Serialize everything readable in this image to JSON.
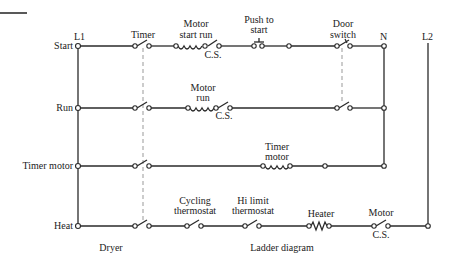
{
  "diagram": {
    "type": "ladder-diagram",
    "caption_left": "Dryer",
    "caption_right": "Ladder diagram",
    "rails": {
      "left": "L1",
      "neutral": "N",
      "right": "L2"
    },
    "rungs": [
      {
        "label": "Start",
        "components": [
          "Timer",
          "Motor start run",
          "C.S.",
          "Push to start",
          "Door switch"
        ]
      },
      {
        "label": "Run",
        "components": [
          "Timer",
          "Motor run",
          "C.S.",
          "Door switch"
        ]
      },
      {
        "label": "Timer motor",
        "components": [
          "Timer",
          "Timer motor"
        ]
      },
      {
        "label": "Heat",
        "components": [
          "Timer",
          "Cycling thermostat",
          "Hi limit thermostat",
          "Heater",
          "Motor C.S."
        ]
      }
    ],
    "labels": {
      "timer": "Timer",
      "motor_start_run_1": "Motor",
      "motor_start_run_2": "start run",
      "cs": "C.S.",
      "push_1": "Push to",
      "push_2": "start",
      "door_1": "Door",
      "door_2": "switch",
      "motor_run_1": "Motor",
      "motor_run_2": "run",
      "timer_motor_1": "Timer",
      "timer_motor_2": "motor",
      "cycling_1": "Cycling",
      "cycling_2": "thermostat",
      "hilimit_1": "Hi limit",
      "hilimit_2": "thermostat",
      "heater": "Heater",
      "motor": "Motor"
    }
  }
}
